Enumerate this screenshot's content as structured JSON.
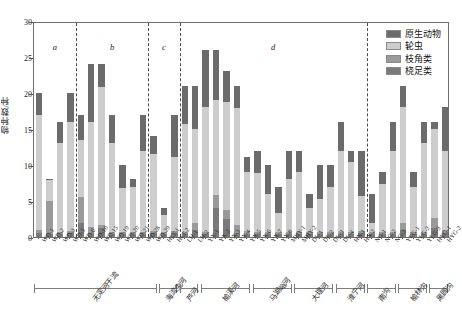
{
  "chart_data": {
    "type": "bar",
    "stacked": true,
    "title": "",
    "xlabel": "",
    "ylabel": "物种数/种",
    "ylim": [
      0,
      30
    ],
    "yticks": [
      0,
      5,
      10,
      15,
      20,
      25,
      30
    ],
    "grid": false,
    "legend_position": "top-right",
    "legend": [
      "原生动物",
      "轮虫",
      "枝角类",
      "桡足类"
    ],
    "series": [
      {
        "name": "桡足类",
        "color": "#7a7a7a",
        "values": [
          0.5,
          0.4,
          0.4,
          0.5,
          2.0,
          0.5,
          1.2,
          0.4,
          0.4,
          0.4,
          0.4,
          0.5,
          0.4,
          0.5,
          0.4,
          1.0,
          0.4,
          4.0,
          2.5,
          0.5,
          0.4,
          0.4,
          0.4,
          0.4,
          0.4,
          0.4,
          0.4,
          0.4,
          0.4,
          0.4,
          0.4,
          0.5,
          0.4,
          0.4,
          0.4,
          1.0,
          0.4,
          0.4,
          1.3,
          0.5
        ]
      },
      {
        "name": "枝角类",
        "color": "#9a9a9a",
        "values": [
          0.5,
          4.6,
          0.3,
          0.4,
          3.5,
          0.9,
          0.5,
          0.3,
          0.3,
          0.3,
          0.3,
          0.3,
          0.3,
          0.3,
          0.3,
          0.9,
          0.3,
          1.8,
          1.2,
          1.2,
          0.4,
          0.3,
          0.3,
          0.3,
          0.3,
          0.3,
          0.3,
          0.3,
          0.3,
          0.3,
          0.3,
          0.4,
          0.3,
          0.3,
          0.3,
          0.9,
          0.3,
          0.3,
          1.3,
          0.5
        ]
      },
      {
        "name": "轮虫",
        "color": "#cdcdcd",
        "values": [
          16.0,
          2.9,
          12.3,
          15.1,
          8.0,
          14.6,
          19.1,
          12.3,
          6.1,
          6.3,
          11.3,
          10.7,
          2.3,
          10.3,
          15.0,
          13.1,
          17.3,
          13.2,
          15.1,
          16.2,
          8.3,
          8.2,
          5.3,
          2.6,
          7.3,
          8.3,
          3.3,
          4.6,
          6.3,
          11.3,
          9.7,
          4.8,
          1.3,
          6.6,
          11.3,
          16.1,
          6.3,
          12.3,
          12.4,
          11.0
        ]
      },
      {
        "name": "原生动物",
        "color": "#6b6b6b",
        "values": [
          3.0,
          0.1,
          3.0,
          4.0,
          3.5,
          8.0,
          3.2,
          4.0,
          3.2,
          1.0,
          5.0,
          2.5,
          1.0,
          5.9,
          5.3,
          6.0,
          8.0,
          7.0,
          4.2,
          3.1,
          2.0,
          3.1,
          4.0,
          3.7,
          4.0,
          3.0,
          2.0,
          4.7,
          3.0,
          4.0,
          1.6,
          6.3,
          4.0,
          1.7,
          4.0,
          3.0,
          2.0,
          3.0,
          1.0,
          6.0
        ]
      }
    ],
    "categories": [
      "WD-1",
      "WD-2",
      "WD-3",
      "WD-5",
      "WD-6",
      "WD-10",
      "WD-15",
      "WD-19",
      "WD-20",
      "WD-21",
      "WD-28",
      "WD-29",
      "HLT-1",
      "HLT-2",
      "LH-1",
      "LH-2",
      "YX-1",
      "YX-2",
      "YX-3",
      "YX-4",
      "YX-5",
      "YX-6",
      "YX-7",
      "YX-8",
      "MHY-1",
      "MHY-2",
      "DL-1",
      "DL-2",
      "DL-3",
      "DL-4",
      "HN-1",
      "HN-2",
      "NG-1",
      "NG-2",
      "NG-3",
      "YLG-1",
      "YLG-2",
      "YLG-3",
      "HYG-1",
      "HYG-2"
    ],
    "regions": [
      {
        "label": "a",
        "start_index": 0,
        "end_index": 3
      },
      {
        "label": "b",
        "start_index": 4,
        "end_index": 10
      },
      {
        "label": "c",
        "start_index": 11,
        "end_index": 13
      },
      {
        "label": "d",
        "start_index": 14,
        "end_index": 31
      },
      {
        "label": "e",
        "start_index": 32,
        "end_index": 39
      }
    ],
    "groups": [
      {
        "name": "无定河干流",
        "start_index": 0,
        "end_index": 11
      },
      {
        "name": "海流兔河",
        "start_index": 12,
        "end_index": 13
      },
      {
        "name": "芦河",
        "start_index": 14,
        "end_index": 15
      },
      {
        "name": "榆溪河",
        "start_index": 16,
        "end_index": 20
      },
      {
        "name": "马湖峪河",
        "start_index": 21,
        "end_index": 24
      },
      {
        "name": "大理河",
        "start_index": 25,
        "end_index": 28
      },
      {
        "name": "淮宁河",
        "start_index": 29,
        "end_index": 31
      },
      {
        "name": "南沟",
        "start_index": 32,
        "end_index": 34
      },
      {
        "name": "榆林沟",
        "start_index": 35,
        "end_index": 37
      },
      {
        "name": "黑圆沟",
        "start_index": 38,
        "end_index": 39
      }
    ]
  }
}
